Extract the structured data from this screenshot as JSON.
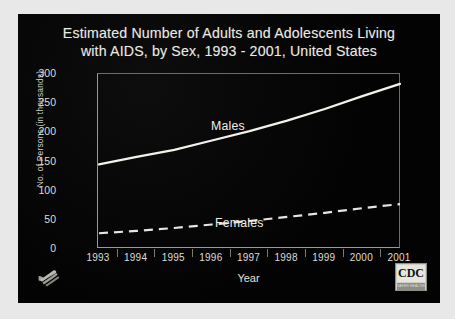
{
  "chart_data": {
    "type": "line",
    "title": "Estimated Number of Adults and Adolescents Living with AIDS, by Sex, 1993 - 2001, United States",
    "title_line1": "Estimated Number of Adults and Adolescents Living",
    "title_line2": "with AIDS, by Sex, 1993 - 2001, United States",
    "xlabel": "Year",
    "ylabel": "No. of Persons (in thousands)",
    "x": [
      "1993",
      "1994",
      "1995",
      "1996",
      "1997",
      "1998",
      "1999",
      "2000",
      "2001"
    ],
    "categories": [
      "1993",
      "1994",
      "1995",
      "1996",
      "1997",
      "1998",
      "1999",
      "2000",
      "2001"
    ],
    "yticks": [
      "0",
      "50",
      "100",
      "150",
      "200",
      "250",
      "300"
    ],
    "ylim": [
      0,
      300
    ],
    "grid": false,
    "legend_position": "inline-labels",
    "series": [
      {
        "name": "Males",
        "style": "solid",
        "color": "#f2f2ea",
        "values": [
          145,
          158,
          170,
          186,
          202,
          220,
          240,
          262,
          283
        ]
      },
      {
        "name": "Females",
        "style": "dashed",
        "color": "#e6e6de",
        "values": [
          27,
          31,
          36,
          42,
          48,
          55,
          62,
          70,
          77
        ]
      }
    ],
    "annotations": [
      {
        "name": "Males",
        "x": "1996",
        "y": 232
      },
      {
        "name": "Females",
        "x": "1997",
        "y": 78
      }
    ]
  },
  "logos": {
    "hhs": "hhs-eagle-logo",
    "cdc_text": "CDC",
    "cdc_strip": "SAFER·HEALTHIER·PEOPLE"
  }
}
